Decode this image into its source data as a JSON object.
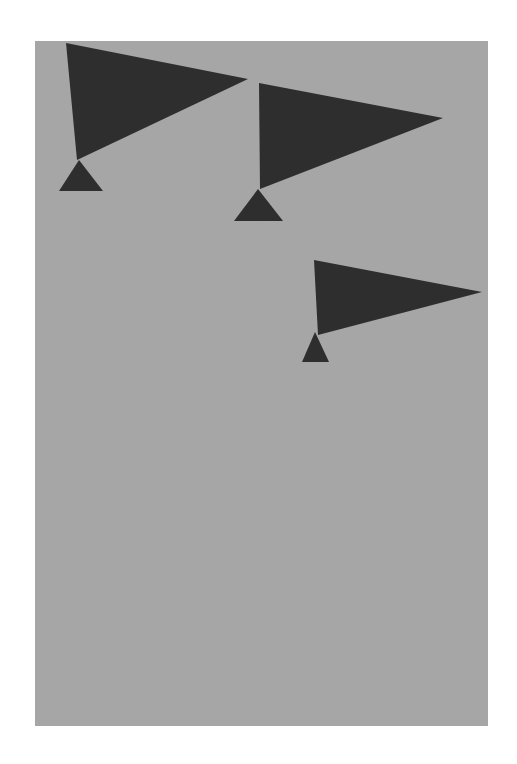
{
  "artwork": {
    "description": "Three dark pennant flags with triangular bases on grey paper",
    "background_color": "#ffffff",
    "paper_color": "#a6a6a6",
    "shape_color": "#2e2e2e",
    "pennants": [
      {
        "flag": [
          [
            66,
            43
          ],
          [
            248,
            79
          ],
          [
            77,
            160
          ]
        ],
        "base": [
          [
            79,
            160
          ],
          [
            59,
            191
          ],
          [
            103,
            191
          ]
        ]
      },
      {
        "flag": [
          [
            259,
            83
          ],
          [
            443,
            118
          ],
          [
            260,
            189
          ]
        ],
        "base": [
          [
            258,
            189
          ],
          [
            234,
            221
          ],
          [
            283,
            221
          ]
        ]
      },
      {
        "flag": [
          [
            314,
            260
          ],
          [
            482,
            292
          ],
          [
            318,
            335
          ]
        ],
        "base": [
          [
            315,
            332
          ],
          [
            302,
            362
          ],
          [
            329,
            362
          ]
        ]
      }
    ]
  }
}
